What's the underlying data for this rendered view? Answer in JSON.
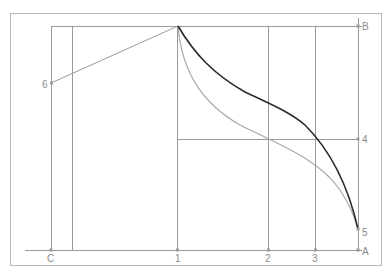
{
  "diagram": {
    "title": "",
    "colors": {
      "frame": "#b0b0b0",
      "construction_line": "#9a9a9a",
      "dark_curve": "#2a2a2a",
      "light_curve": "#a8a8a8",
      "label": "#8a8a8a"
    },
    "labels": {
      "B": "B",
      "A": "A",
      "C": "C",
      "p1": "1",
      "p2": "2",
      "p3": "3",
      "p4": "4",
      "p5": "5",
      "p6": "6"
    },
    "points": {
      "apex": [
        178,
        26
      ],
      "B": [
        358,
        26
      ],
      "A": [
        358,
        250
      ],
      "C": [
        51,
        250
      ],
      "p1": [
        178,
        250
      ],
      "p2": [
        268,
        250
      ],
      "p3": [
        315,
        250
      ],
      "p4": [
        358,
        139
      ],
      "p5": [
        358,
        229
      ],
      "p6": [
        51,
        83
      ]
    },
    "curves": [
      {
        "name": "dark-curve",
        "description": "S-curve from apex to point 5 through line 4 at line 3"
      },
      {
        "name": "light-curve",
        "description": "Concave curve from apex to point 5 through line 4 at line 2"
      }
    ]
  }
}
